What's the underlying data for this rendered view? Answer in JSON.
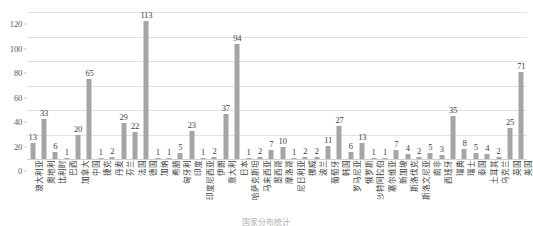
{
  "chart_data": {
    "type": "bar",
    "title": "",
    "xlabel": "",
    "ylabel": "",
    "ylim": [
      0,
      120
    ],
    "y_ticks": [
      0,
      20,
      40,
      60,
      80,
      100,
      120
    ],
    "grid": true,
    "legend": "none",
    "bar_color": "#a5a5a5",
    "show_value_labels": true,
    "x_tick_rotation": -90,
    "categories": [
      "澳大利亚",
      "奥地利",
      "比利时",
      "巴西",
      "加拿大",
      "中国",
      "捷克",
      "丹麦",
      "芬兰",
      "法国",
      "德国",
      "加纳",
      "希腊",
      "匈牙利",
      "印度",
      "印度尼西亚",
      "伊朗",
      "意大利",
      "日本",
      "哈萨克斯坦",
      "马来西亚",
      "墨西哥",
      "摩洛哥",
      "尼日利亚",
      "挪威",
      "波兰",
      "葡萄牙",
      "韩国",
      "罗马尼亚",
      "俄罗斯",
      "沙特阿拉伯",
      "塞尔维亚",
      "新加坡",
      "斯洛伐克",
      "斯洛文尼亚",
      "南非",
      "西班牙",
      "瑞典",
      "瑞士",
      "泰国",
      "土耳其",
      "乌克兰",
      "英国",
      "美国"
    ],
    "values": [
      13,
      33,
      6,
      1,
      20,
      65,
      1,
      2,
      29,
      22,
      113,
      1,
      1,
      5,
      23,
      1,
      2,
      37,
      94,
      1,
      2,
      7,
      10,
      1,
      2,
      2,
      11,
      27,
      6,
      13,
      1,
      1,
      7,
      4,
      2,
      5,
      3,
      35,
      8,
      5,
      4,
      2,
      25,
      71
    ]
  },
  "caption": "国家分布统计"
}
